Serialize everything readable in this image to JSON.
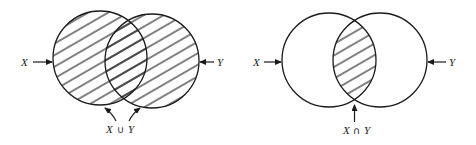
{
  "figure": {
    "type": "venn-diagrams",
    "colors": {
      "stroke": "#1a1a1a",
      "background": "#ffffff"
    },
    "panels": [
      {
        "id": "union",
        "sets": [
          {
            "label": "X",
            "cx": 100,
            "cy": 58,
            "r": 47
          },
          {
            "label": "Y",
            "cx": 152,
            "cy": 61,
            "r": 47
          }
        ],
        "shaded_region": "union",
        "caption": {
          "left": "X",
          "op": "∪",
          "right": "Y"
        }
      },
      {
        "id": "intersection",
        "sets": [
          {
            "label": "X",
            "cx": 329,
            "cy": 60,
            "r": 47
          },
          {
            "label": "Y",
            "cx": 380,
            "cy": 60,
            "r": 47
          }
        ],
        "shaded_region": "intersection",
        "caption": {
          "left": "X",
          "op": "∩",
          "right": "Y"
        }
      }
    ]
  }
}
